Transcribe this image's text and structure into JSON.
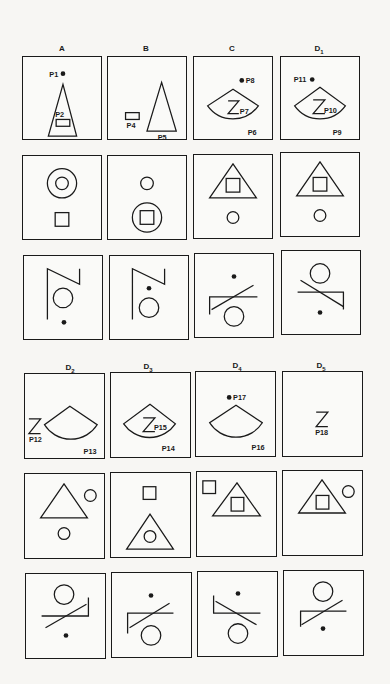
{
  "figure": {
    "top_section": {
      "column_labels": [
        {
          "id": "A",
          "text": "A",
          "sub": ""
        },
        {
          "id": "B",
          "text": "B",
          "sub": ""
        },
        {
          "id": "C",
          "text": "C",
          "sub": ""
        },
        {
          "id": "D1",
          "text": "D",
          "sub": "1"
        }
      ],
      "rows": [
        {
          "row": 1,
          "panels": [
            {
              "col": "A",
              "description": "dot P1 above triangle P3 containing rectangle P2",
              "labels": [
                "P1",
                "P2",
                "P3"
              ]
            },
            {
              "col": "B",
              "description": "rectangle P4 beside triangle P5",
              "labels": [
                "P4",
                "P5"
              ]
            },
            {
              "col": "C",
              "description": "dot P8 above sector P6 containing Z-shape P7",
              "labels": [
                "P8",
                "P7",
                "P6"
              ]
            },
            {
              "col": "D1",
              "description": "dot P11 above sector P9 containing Z-shape P10",
              "labels": [
                "P11",
                "P10",
                "P9"
              ]
            }
          ]
        },
        {
          "row": 2,
          "panels": [
            {
              "col": "A",
              "description": "small circle inside large circle, square below"
            },
            {
              "col": "B",
              "description": "small circle above, square inside large circle below"
            },
            {
              "col": "C",
              "description": "square inside triangle, small circle below"
            },
            {
              "col": "D1",
              "description": "square inside triangle, small circle below"
            }
          ]
        },
        {
          "row": 3,
          "panels": [
            {
              "col": "A",
              "description": "Z-like stroke, circle below, dot at bottom"
            },
            {
              "col": "B",
              "description": "Z-like stroke, dot then circle below"
            },
            {
              "col": "C",
              "description": "dot above, slanted line over bracket, circle below"
            },
            {
              "col": "D1",
              "description": "circle above, slanted line over bracket, dot below"
            }
          ]
        }
      ]
    },
    "bottom_section": {
      "column_labels": [
        {
          "id": "D2",
          "text": "D",
          "sub": "2"
        },
        {
          "id": "D3",
          "text": "D",
          "sub": "3"
        },
        {
          "id": "D4",
          "text": "D",
          "sub": "4"
        },
        {
          "id": "D5",
          "text": "D",
          "sub": "5"
        }
      ],
      "rows": [
        {
          "row": 4,
          "panels": [
            {
              "col": "D2",
              "description": "Z-shape P12 left of sector P13",
              "labels": [
                "P12",
                "P13"
              ]
            },
            {
              "col": "D3",
              "description": "sector P14 containing Z-shape P15",
              "labels": [
                "P15",
                "P14"
              ]
            },
            {
              "col": "D4",
              "description": "dot P17 above sector P16",
              "labels": [
                "P17",
                "P16"
              ]
            },
            {
              "col": "D5",
              "description": "Z-shape P18 alone",
              "labels": [
                "P18"
              ]
            }
          ]
        },
        {
          "row": 5,
          "panels": [
            {
              "col": "D2",
              "description": "triangle with small circle to upper right, small circle below"
            },
            {
              "col": "D3",
              "description": "square above, triangle containing circle below"
            },
            {
              "col": "D4",
              "description": "square upper left, triangle containing square"
            },
            {
              "col": "D5",
              "description": "triangle containing square, small circle upper right"
            }
          ]
        },
        {
          "row": 6,
          "panels": [
            {
              "col": "D2",
              "description": "circle above, slanted line over bracket, dot below"
            },
            {
              "col": "D3",
              "description": "dot above, slanted line over bracket, circle below"
            },
            {
              "col": "D4",
              "description": "dot above, slanted line over bracket, circle below"
            },
            {
              "col": "D5",
              "description": "circle above, slanted line over bracket, dot below"
            }
          ]
        }
      ]
    }
  }
}
